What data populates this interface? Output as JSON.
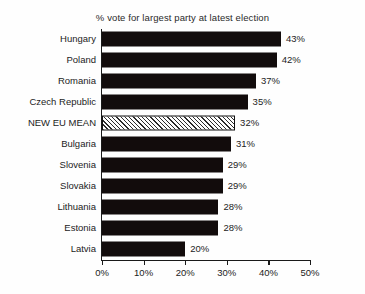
{
  "chart_data": {
    "type": "bar",
    "orientation": "horizontal",
    "title": "% vote for largest party at latest election",
    "xlabel": "",
    "ylabel": "",
    "xlim": [
      0,
      50
    ],
    "grid": false,
    "legend": false,
    "xticks": [
      "0%",
      "10%",
      "20%",
      "30%",
      "40%",
      "50%"
    ],
    "xtick_values": [
      0,
      10,
      20,
      30,
      40,
      50
    ],
    "categories": [
      "Hungary",
      "Poland",
      "Romania",
      "Czech Republic",
      "NEW EU MEAN",
      "Bulgaria",
      "Slovenia",
      "Slovakia",
      "Lithuania",
      "Estonia",
      "Latvia"
    ],
    "values": [
      43,
      42,
      37,
      35,
      32,
      31,
      29,
      29,
      28,
      28,
      20
    ],
    "value_labels": [
      "43%",
      "42%",
      "37%",
      "35%",
      "32%",
      "31%",
      "29%",
      "29%",
      "28%",
      "28%",
      "20%"
    ],
    "highlight_category": "NEW EU MEAN",
    "bar_color": "#120c0c",
    "highlight_fill": "hatched-diagonal",
    "highlight_border_color": "#111111",
    "background_color": "#fefefe"
  }
}
